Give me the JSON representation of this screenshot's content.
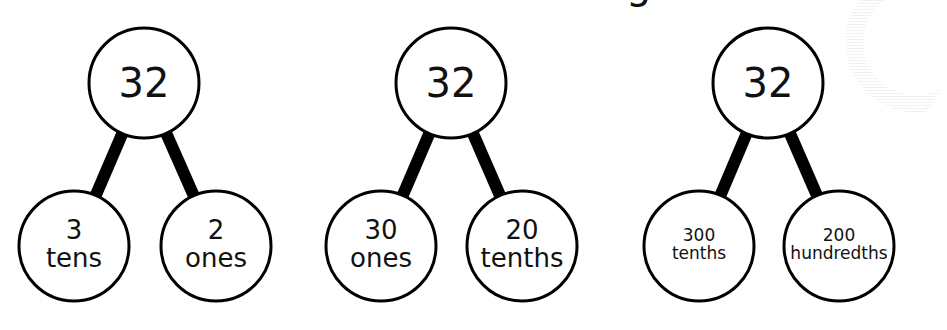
{
  "title_fragment": "g",
  "colors": {
    "stroke": "#000000",
    "fill": "#ffffff",
    "text": "#111111"
  },
  "trees": [
    {
      "root": {
        "label": "32",
        "cx": 144,
        "cy": 83,
        "r": 55
      },
      "left": {
        "line1": "3",
        "line2": "tens",
        "cx": 74,
        "cy": 246,
        "r": 55,
        "font": 26
      },
      "right": {
        "line1": "2",
        "line2": "ones",
        "cx": 216,
        "cy": 246,
        "r": 55,
        "font": 26
      }
    },
    {
      "root": {
        "label": "32",
        "cx": 451,
        "cy": 83,
        "r": 55
      },
      "left": {
        "line1": "30",
        "line2": "ones",
        "cx": 381,
        "cy": 246,
        "r": 55,
        "font": 26
      },
      "right": {
        "line1": "20",
        "line2": "tenths",
        "cx": 522,
        "cy": 246,
        "r": 55,
        "font": 26
      }
    },
    {
      "root": {
        "label": "32",
        "cx": 768,
        "cy": 83,
        "r": 55
      },
      "left": {
        "line1": "300",
        "line2": "tenths",
        "cx": 699,
        "cy": 246,
        "r": 55,
        "font": 17
      },
      "right": {
        "line1": "200",
        "line2": "hundredths",
        "cx": 839,
        "cy": 246,
        "r": 55,
        "font": 17
      }
    }
  ]
}
